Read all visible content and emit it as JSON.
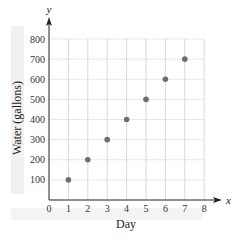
{
  "chart_data": {
    "type": "scatter",
    "title": "",
    "xlabel": "Day",
    "ylabel": "Water (gallons)",
    "x_axis_var": "x",
    "y_axis_var": "y",
    "x": [
      1,
      2,
      3,
      4,
      5,
      6,
      7
    ],
    "series": [
      {
        "name": "Water",
        "values": [
          100,
          200,
          300,
          400,
          500,
          600,
          700
        ]
      }
    ],
    "xlim": [
      0,
      8
    ],
    "ylim": [
      0,
      800
    ],
    "x_ticks": [
      "0",
      "1",
      "2",
      "3",
      "4",
      "5",
      "6",
      "7",
      "8"
    ],
    "y_ticks": [
      "100",
      "200",
      "300",
      "400",
      "500",
      "600",
      "700",
      "800"
    ],
    "grid": true,
    "legend": "none",
    "point_color": "#6e6e6e",
    "grid_color": "#cfcfcf",
    "axis_color": "#222222"
  }
}
